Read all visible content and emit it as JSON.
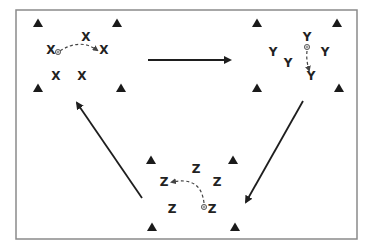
{
  "diagram": {
    "type": "drill-rotation",
    "frame": {
      "x": 16,
      "y": 10,
      "width": 341,
      "height": 229,
      "color": "#8a8a8a"
    },
    "colors": {
      "cone": "#1a1a1a",
      "player": "#222222",
      "arrow": "#1e1e1e",
      "pass": "#444444"
    },
    "groups": [
      {
        "id": "group-x",
        "label": "X",
        "cones": [
          [
            38,
            23
          ],
          [
            117,
            23
          ],
          [
            38,
            88
          ],
          [
            121,
            88
          ]
        ],
        "players": [
          {
            "label": "X",
            "x": 86,
            "y": 37
          },
          {
            "label": "X",
            "x": 51,
            "y": 50
          },
          {
            "label": "X",
            "x": 104,
            "y": 50
          },
          {
            "label": "X",
            "x": 56,
            "y": 76
          },
          {
            "label": "X",
            "x": 82,
            "y": 76
          }
        ],
        "ball": {
          "x": 58,
          "y": 52
        },
        "pass": {
          "path": "M60,51 Q80,38 97,50"
        }
      },
      {
        "id": "group-y",
        "label": "Y",
        "cones": [
          [
            257,
            23
          ],
          [
            337,
            23
          ],
          [
            257,
            88
          ],
          [
            339,
            88
          ]
        ],
        "players": [
          {
            "label": "Y",
            "x": 307,
            "y": 37
          },
          {
            "label": "Y",
            "x": 273,
            "y": 52
          },
          {
            "label": "Y",
            "x": 325,
            "y": 52
          },
          {
            "label": "Y",
            "x": 288,
            "y": 63
          },
          {
            "label": "Y",
            "x": 311,
            "y": 76
          }
        ],
        "ball": {
          "x": 307,
          "y": 47
        },
        "pass": {
          "path": "M307,51 Q306,60 309,70"
        }
      },
      {
        "id": "group-z",
        "label": "Z",
        "cones": [
          [
            151,
            160
          ],
          [
            233,
            160
          ],
          [
            152,
            227
          ],
          [
            235,
            227
          ]
        ],
        "players": [
          {
            "label": "Z",
            "x": 196,
            "y": 169
          },
          {
            "label": "Z",
            "x": 164,
            "y": 182
          },
          {
            "label": "Z",
            "x": 217,
            "y": 182
          },
          {
            "label": "Z",
            "x": 172,
            "y": 209
          },
          {
            "label": "Z",
            "x": 212,
            "y": 209
          }
        ],
        "ball": {
          "x": 204,
          "y": 207
        },
        "pass": {
          "path": "M204,203 Q201,176 172,182"
        }
      }
    ],
    "rotation_arrows": [
      {
        "id": "x-to-y",
        "from": [
          148,
          60
        ],
        "to": [
          230,
          60
        ]
      },
      {
        "id": "y-to-z",
        "from": [
          303,
          101
        ],
        "to": [
          246,
          202
        ]
      },
      {
        "id": "z-to-x",
        "from": [
          142,
          198
        ],
        "to": [
          77,
          103
        ]
      }
    ]
  }
}
